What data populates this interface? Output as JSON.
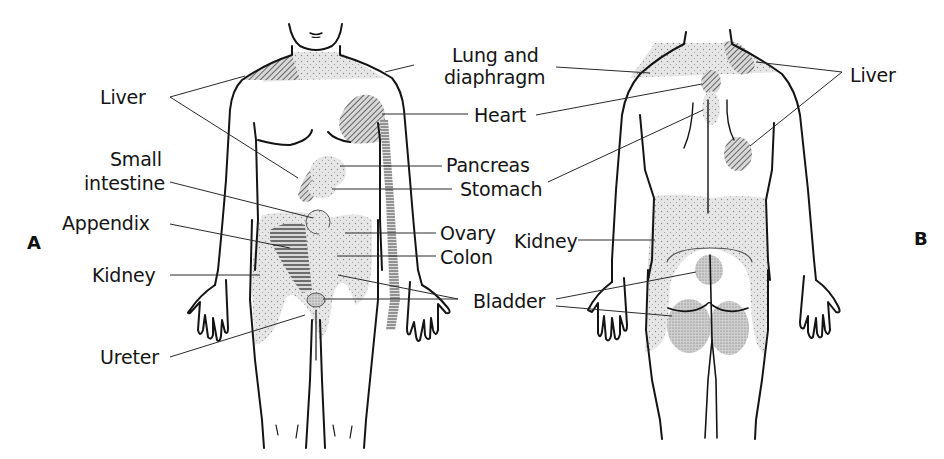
{
  "figure": {
    "panels": [
      {
        "id": "A",
        "label": "A",
        "view": "anterior"
      },
      {
        "id": "B",
        "label": "B",
        "view": "posterior"
      }
    ],
    "colors": {
      "outline": "#141414",
      "stipple_fill": "#e4e4e4",
      "dense_stipple_fill": "#c8c8c8",
      "leader_line": "#2a2a2a"
    },
    "front_labels": {
      "liver": "Liver",
      "small_intestine_line1": "Small",
      "small_intestine_line2": "intestine",
      "appendix": "Appendix",
      "kidney": "Kidney",
      "ureter": "Ureter"
    },
    "center_labels": {
      "lung_line1": "Lung and",
      "lung_line2": "diaphragm",
      "heart": "Heart",
      "pancreas": "Pancreas",
      "stomach": "Stomach",
      "ovary": "Ovary",
      "colon": "Colon",
      "bladder": "Bladder"
    },
    "back_labels": {
      "liver": "Liver",
      "kidney": "Kidney"
    }
  }
}
